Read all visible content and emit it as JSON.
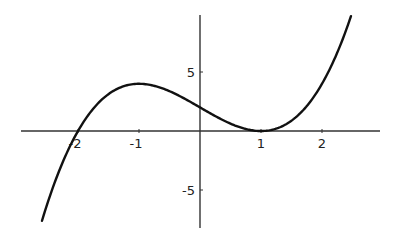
{
  "chart_data": {
    "type": "line",
    "title": "",
    "xlabel": "",
    "ylabel": "",
    "function": "(x+2)(x-1)^2",
    "xlim": [
      -2.92,
      2.95
    ],
    "ylim": [
      -8.3,
      9.9
    ],
    "grid": false,
    "legend": null,
    "x_ticks": [
      {
        "value": -2,
        "label": "-2"
      },
      {
        "value": -1,
        "label": "-1"
      },
      {
        "value": 1,
        "label": "1"
      },
      {
        "value": 2,
        "label": "2"
      }
    ],
    "y_ticks": [
      {
        "value": 5,
        "label": "5"
      },
      {
        "value": -5,
        "label": "-5"
      }
    ],
    "series": [
      {
        "name": "f(x)",
        "x": [
          -2.59,
          -2.5,
          -2.25,
          -2.0,
          -1.75,
          -1.5,
          -1.25,
          -1.0,
          -0.75,
          -0.5,
          -0.25,
          0.0,
          0.25,
          0.5,
          0.75,
          1.0,
          1.25,
          1.5,
          1.75,
          2.0,
          2.25,
          2.475
        ],
        "values": [
          -7.6,
          -6.13,
          -2.64,
          0.0,
          1.89,
          3.13,
          3.8,
          4.0,
          3.83,
          3.38,
          2.73,
          2.0,
          1.27,
          0.63,
          0.17,
          0.0,
          0.2,
          0.88,
          2.11,
          4.0,
          6.64,
          9.76
        ]
      }
    ],
    "colors": {
      "curve": "#111111",
      "axis": "#333333",
      "background": "#ffffff"
    }
  }
}
